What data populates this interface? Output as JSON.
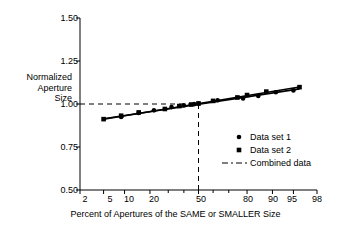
{
  "chart_data": {
    "type": "scatter",
    "title": "",
    "xlabel": "Percent of Apertures of the SAME or SMALLER Size",
    "ylabel": "Normalized Aperture Size",
    "ylabel_lines": [
      "Normalized",
      "Aperture",
      "Size"
    ],
    "x_scale": "probability",
    "xlim": [
      2,
      98
    ],
    "ylim": [
      0.5,
      1.5
    ],
    "grid": false,
    "legend_position": "bottom-right",
    "yticks": [
      "1.50",
      "1.25",
      "1.00",
      "0.75",
      "0.50"
    ],
    "ytick_values": [
      1.5,
      1.25,
      1.0,
      0.75,
      0.5
    ],
    "xticks": [
      "2",
      "5",
      "10",
      "20",
      "50",
      "80",
      "90",
      "95",
      "98"
    ],
    "xtick_values": [
      2,
      5,
      10,
      20,
      50,
      80,
      90,
      95,
      98
    ],
    "x_minor_ticks": [
      30,
      40,
      60,
      70
    ],
    "series": [
      {
        "name": "Data set 1",
        "marker": "circle",
        "x": [
          9,
          15,
          22,
          32,
          40,
          47,
          50,
          63,
          78,
          85,
          91,
          95
        ],
        "y": [
          0.925,
          0.948,
          0.963,
          0.982,
          0.992,
          0.999,
          1.002,
          1.022,
          1.032,
          1.047,
          1.068,
          1.079
        ]
      },
      {
        "name": "Data set 2",
        "marker": "square",
        "x": [
          5,
          9,
          15,
          28,
          37,
          45,
          50,
          60,
          75,
          80,
          88,
          96
        ],
        "y": [
          0.912,
          0.932,
          0.951,
          0.971,
          0.988,
          0.997,
          1.003,
          1.018,
          1.038,
          1.052,
          1.072,
          1.098
        ]
      }
    ],
    "fit_lines": [
      {
        "name": "Data set 1 fit",
        "x1": 5,
        "y1": 0.914,
        "x2": 96,
        "y2": 1.088
      },
      {
        "name": "Data set 2 fit",
        "x1": 5,
        "y1": 0.911,
        "x2": 96,
        "y2": 1.099
      }
    ],
    "reference_lines": [
      {
        "name": "horizontal-reference",
        "orientation": "horizontal",
        "value": 1.0,
        "from_x": 2,
        "to_x": 50,
        "style": "dashed"
      },
      {
        "name": "vertical-reference",
        "orientation": "vertical",
        "value": 50,
        "from_y": 0.5,
        "to_y": 1.0,
        "style": "dashed"
      }
    ],
    "legend": [
      {
        "label": "Data set 1",
        "marker": "circle"
      },
      {
        "label": "Data set 2",
        "marker": "square"
      },
      {
        "label": "Combined data",
        "marker": "dash-dot-line"
      }
    ],
    "colors": {
      "ink": "#000000",
      "background": "#ffffff"
    }
  }
}
